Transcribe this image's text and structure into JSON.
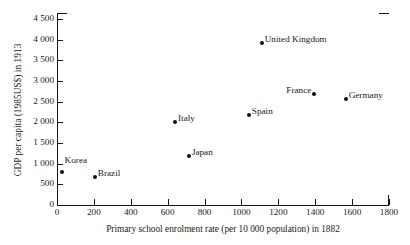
{
  "chart_data": {
    "type": "scatter",
    "title": "",
    "xlabel": "Primary school enrolment rate (per 10 000 population) in 1882",
    "ylabel": "GDP per capita (1985US$) in 1913",
    "xlim": [
      0,
      1800
    ],
    "ylim": [
      0,
      4500
    ],
    "xticks": [
      "0",
      "200",
      "400",
      "600",
      "800",
      "1000",
      "1200",
      "1400",
      "1600",
      "1800"
    ],
    "xtick_values": [
      0,
      200,
      400,
      600,
      800,
      1000,
      1200,
      1400,
      1600,
      1800
    ],
    "yticks": [
      "0",
      "500",
      "1 000",
      "1 500",
      "2 000",
      "2 500",
      "3 000",
      "3 500",
      "4 000",
      "4 500"
    ],
    "ytick_values": [
      0,
      500,
      1000,
      1500,
      2000,
      2500,
      3000,
      3500,
      4000,
      4500
    ],
    "grid": false,
    "legend": "none",
    "marker_color": "#111111",
    "points": [
      {
        "label": "Korea",
        "x": 25,
        "y": 790,
        "label_side": "right",
        "label_dy": -8
      },
      {
        "label": "Brazil",
        "x": 205,
        "y": 680,
        "label_side": "right",
        "label_dy": 0
      },
      {
        "label": "Japan",
        "x": 715,
        "y": 1180,
        "label_side": "right",
        "label_dy": 0
      },
      {
        "label": "Italy",
        "x": 640,
        "y": 2000,
        "label_side": "right",
        "label_dy": 0
      },
      {
        "label": "Spain",
        "x": 1040,
        "y": 2180,
        "label_side": "right",
        "label_dy": 0
      },
      {
        "label": "United Kingdom",
        "x": 1110,
        "y": 3930,
        "label_side": "right",
        "label_dy": 0
      },
      {
        "label": "France",
        "x": 1395,
        "y": 2680,
        "label_side": "left",
        "label_dy": 0
      },
      {
        "label": "Germany",
        "x": 1565,
        "y": 2570,
        "label_side": "right",
        "label_dy": 0
      }
    ]
  }
}
